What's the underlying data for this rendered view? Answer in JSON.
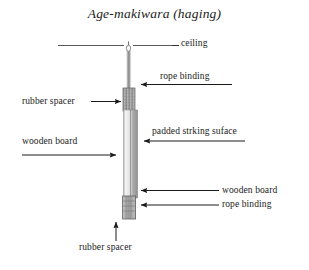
{
  "figure": {
    "title": "Age-makiwara (haging)",
    "background_color": "#ffffff",
    "ink_color": "#1a1a1a"
  },
  "labels": {
    "ceiling": "ceiling",
    "rope_binding_top": "rope binding",
    "rubber_spacer_top": "rubber spacer",
    "padded_striking_surface": "padded strking suface",
    "wooden_board_left": "wooden board",
    "wooden_board_right": "wooden board",
    "rope_binding_bottom": "rope binding",
    "rubber_spacer_bottom": "rubber spacer"
  },
  "diagram": {
    "parts": [
      {
        "name": "ceiling-line",
        "kind": "horizontal-line",
        "x1": 58,
        "x2": 172,
        "y": 45,
        "color": "#555555"
      },
      {
        "name": "ceiling-hook",
        "kind": "eyelet",
        "x": 128,
        "y": 45,
        "color": "#777777"
      },
      {
        "name": "hanging-rope",
        "kind": "vertical-line",
        "x": 129,
        "y1": 50,
        "y2": 90,
        "color": "#999999"
      },
      {
        "name": "rope-binding-upper",
        "kind": "hatched-block",
        "x": 123,
        "y": 88,
        "width": 12,
        "height": 23,
        "color": "#8a8a8a"
      },
      {
        "name": "wooden-board",
        "kind": "vertical-strip",
        "x": 124,
        "y": 110,
        "width": 6,
        "height": 86,
        "color": "#f2f2f2"
      },
      {
        "name": "padded-striking-surface",
        "kind": "vertical-strip",
        "x": 131,
        "y": 110,
        "width": 7,
        "height": 86,
        "color": "#bdbdbd"
      },
      {
        "name": "rope-binding-lower",
        "kind": "hatched-block",
        "x": 123,
        "y": 196,
        "width": 12,
        "height": 22,
        "color": "#8a8a8a"
      },
      {
        "name": "rubber-spacer-bottom",
        "kind": "solid-block",
        "x": 123,
        "y": 196,
        "width": 12,
        "height": 22,
        "color": "#a8a8a8"
      }
    ],
    "colors": {
      "ceiling_line": "#555555",
      "rope": "#999999",
      "binding_block": "#8a8a8a",
      "wooden_board": "#f2f2f2",
      "padded_surface": "#bdbdbd",
      "rubber_spacer": "#a8a8a8",
      "arrow": "#1a1a1a"
    }
  }
}
